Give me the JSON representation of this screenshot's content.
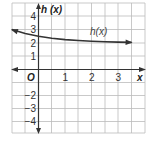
{
  "chart_data": {
    "type": "line",
    "title": "",
    "xlabel": "x",
    "ylabel": "h (x)",
    "origin_label": "O",
    "xlim": [
      -1,
      4
    ],
    "ylim": [
      -5,
      5
    ],
    "x_ticks": [
      "1",
      "2",
      "3"
    ],
    "y_ticks": [
      "4",
      "3",
      "2",
      "1",
      "−2",
      "−3",
      "−4"
    ],
    "grid": true,
    "series": [
      {
        "name": "h(x)",
        "label": "h(x)",
        "x": [
          -1,
          -0.5,
          0,
          0.5,
          1,
          1.5,
          2,
          2.5,
          3,
          3.5
        ],
        "values": [
          3.0,
          2.71,
          2.5,
          2.35,
          2.25,
          2.18,
          2.13,
          2.09,
          2.06,
          2.04
        ]
      }
    ],
    "colors": {
      "curve": "#333333",
      "axis": "#333333",
      "grid": "#bbbbbb"
    }
  }
}
